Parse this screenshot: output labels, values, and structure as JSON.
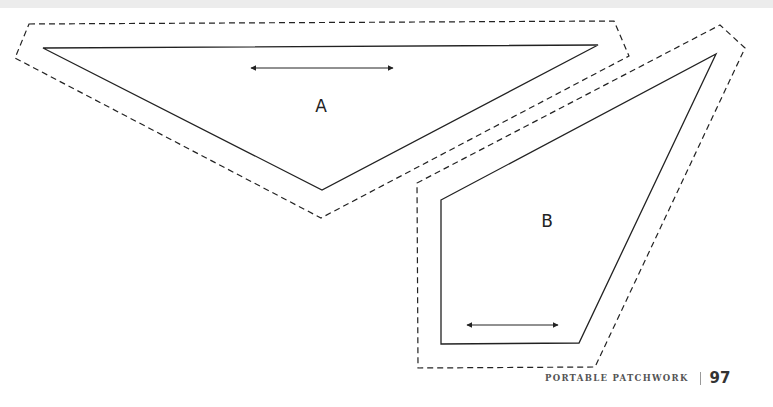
{
  "page": {
    "top_strip_color": "#ececec",
    "background": "#ffffff"
  },
  "pieces": [
    {
      "label": "A",
      "cut_line": "29,24 614,21 629,56 321,218 15,58",
      "sew_line": "43,48 598,45 322,190",
      "grain_arrow": {
        "x1": 251,
        "y1": 68,
        "x2": 393,
        "y2": 68
      },
      "label_pos": {
        "x": 321,
        "y": 106
      }
    },
    {
      "label": "B",
      "cut_line": "417,183 720,25 745,48 595,367 418,368",
      "sew_line": "441,200 716,54 579,343 441,344",
      "grain_arrow": {
        "x1": 467,
        "y1": 325,
        "x2": 558,
        "y2": 325
      },
      "label_pos": {
        "x": 547,
        "y": 221
      }
    }
  ],
  "footer": {
    "book_title": "PORTABLE PATCHWORK",
    "page_number": "97"
  }
}
